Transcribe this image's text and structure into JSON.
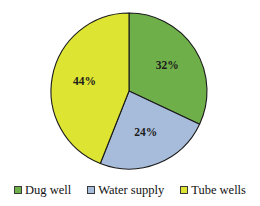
{
  "chart_data": {
    "type": "pie",
    "title": "",
    "categories": [
      "Dug well",
      "Water supply",
      "Tube wells"
    ],
    "values": [
      32,
      24,
      44
    ],
    "data_labels": [
      "32%",
      "24%",
      "44%"
    ],
    "unit": "%",
    "start_angle_deg": 0,
    "direction": "clockwise",
    "colors": [
      "#6FAF4A",
      "#A7BCDA",
      "#DDE431"
    ],
    "legend": {
      "position": "bottom",
      "entries": [
        {
          "label": "Dug well",
          "color": "#6FAF4A",
          "value": 32
        },
        {
          "label": "Water supply",
          "color": "#A7BCDA",
          "value": 24
        },
        {
          "label": "Tube wells",
          "color": "#DDE431",
          "value": 44
        }
      ]
    },
    "slices": [
      {
        "label": "Dug well",
        "value": 32,
        "display": "32%",
        "color": "#6FAF4A"
      },
      {
        "label": "Water supply",
        "value": 24,
        "display": "24%",
        "color": "#A7BCDA"
      },
      {
        "label": "Tube wells",
        "value": 44,
        "display": "44%",
        "color": "#DDE431"
      }
    ],
    "xlabel": "",
    "ylabel": "",
    "grid": false,
    "outline_color": "#1a1a1a",
    "background": "#ffffff"
  }
}
